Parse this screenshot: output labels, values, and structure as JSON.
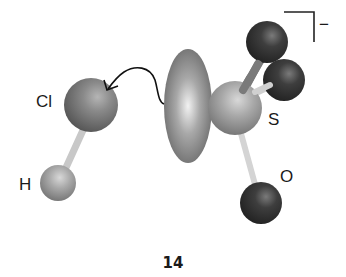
{
  "figure": {
    "number_label": "14",
    "charge": "−",
    "atoms": [
      {
        "id": "Cl",
        "label": "Cl",
        "cx": 91,
        "cy": 105,
        "r": 27,
        "shade": "mid"
      },
      {
        "id": "H",
        "label": "H",
        "cx": 58,
        "cy": 183,
        "r": 18,
        "shade": "light"
      },
      {
        "id": "S",
        "label": "S",
        "cx": 235,
        "cy": 108,
        "r": 27,
        "shade": "light"
      },
      {
        "id": "O1",
        "label": "",
        "cx": 267,
        "cy": 42,
        "r": 21,
        "shade": "dark"
      },
      {
        "id": "O2",
        "label": "",
        "cx": 284,
        "cy": 80,
        "r": 21,
        "shade": "dark"
      },
      {
        "id": "O3",
        "label": "O",
        "cx": 261,
        "cy": 203,
        "r": 21,
        "shade": "dark"
      }
    ],
    "labels": {
      "cl": "Cl",
      "h": "H",
      "s": "S",
      "o": "O"
    },
    "lone_pair_lobe": {
      "cx": 188,
      "cy": 106,
      "rx": 24,
      "ry": 57
    },
    "arrow": {
      "description": "curved arrow from lobe to Cl"
    }
  }
}
